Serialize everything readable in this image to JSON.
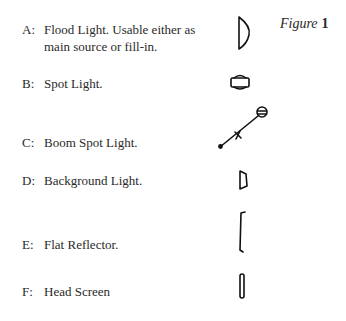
{
  "figure": {
    "word": "Figure",
    "number": "1"
  },
  "items": [
    {
      "letter": "A:",
      "lines": [
        "Flood Light. Usable either as",
        "main source or fill-in."
      ],
      "icon": "flood-light-icon"
    },
    {
      "letter": "B:",
      "lines": [
        "Spot Light."
      ],
      "icon": "spot-light-icon"
    },
    {
      "letter": "C:",
      "lines": [
        "Boom Spot Light."
      ],
      "icon": "boom-spot-light-icon"
    },
    {
      "letter": "D:",
      "lines": [
        "Background Light."
      ],
      "icon": "background-light-icon"
    },
    {
      "letter": "E:",
      "lines": [
        "Flat Reflector."
      ],
      "icon": "flat-reflector-icon"
    },
    {
      "letter": "F:",
      "lines": [
        "Head Screen"
      ],
      "icon": "head-screen-icon"
    }
  ]
}
